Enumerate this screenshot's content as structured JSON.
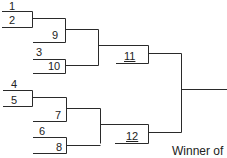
{
  "bracket": {
    "entrants": [
      {
        "id": "1",
        "label": "1"
      },
      {
        "id": "2",
        "label": "2"
      },
      {
        "id": "3",
        "label": "3"
      },
      {
        "id": "4",
        "label": "4"
      },
      {
        "id": "5",
        "label": "5"
      },
      {
        "id": "6",
        "label": "6"
      }
    ],
    "games": [
      {
        "id": "7",
        "label": "7"
      },
      {
        "id": "8",
        "label": "8"
      },
      {
        "id": "9",
        "label": "9"
      },
      {
        "id": "10",
        "label": "10"
      },
      {
        "id": "11",
        "label": "11"
      },
      {
        "id": "12",
        "label": "12"
      }
    ],
    "caption": "Winner of",
    "line_color": "#2a2a2a"
  }
}
